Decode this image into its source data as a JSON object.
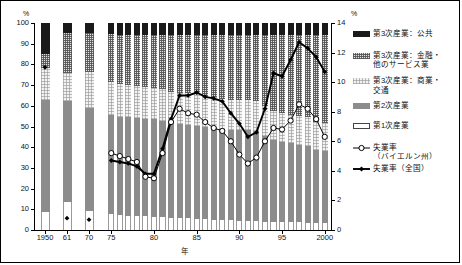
{
  "axes": {
    "left_unit": "%",
    "right_unit": "%",
    "xlabel": "年",
    "left_ticks": [
      "0",
      "10",
      "20",
      "30",
      "40",
      "50",
      "60",
      "70",
      "80",
      "90",
      "100"
    ],
    "right_ticks": [
      "0",
      "2",
      "4",
      "6",
      "8",
      "10",
      "12",
      "14"
    ],
    "x_ticks": [
      "1950",
      "61",
      "70",
      "75",
      "80",
      "85",
      "90",
      "95",
      "2000"
    ]
  },
  "legend": {
    "items": [
      {
        "name": "tertiary-public",
        "label": "第3次産業：公共",
        "label2": "",
        "swatch": "solid-black",
        "color": "#1a1a1a"
      },
      {
        "name": "tertiary-finance",
        "label": "第3次産業：金融・",
        "label2": "他のサービス業",
        "swatch": "hatch-dark",
        "color": "#e2e2e2"
      },
      {
        "name": "tertiary-commerce",
        "label": "第3次産業：商業・",
        "label2": "交通",
        "swatch": "hatch-light",
        "color": "#f2f2f2"
      },
      {
        "name": "secondary",
        "label": "第2次産業",
        "label2": "",
        "swatch": "solid-gray",
        "color": "#8c8c8c"
      },
      {
        "name": "primary",
        "label": "第1次産業",
        "label2": "",
        "swatch": "outline-white",
        "color": "#ffffff"
      },
      {
        "name": "unemp-bavaria",
        "label": "失業率",
        "label2": "（バイエルン州）",
        "swatch": "line-open-circle",
        "color": "#000000"
      },
      {
        "name": "unemp-national",
        "label": "失業率（全国）",
        "label2": "",
        "swatch": "line-filled-diamond",
        "color": "#000000"
      }
    ]
  },
  "chart_data": {
    "type": "bar",
    "title": "",
    "xlabel": "年",
    "ylabel": "%",
    "ylim": [
      0,
      100
    ],
    "y2lim": [
      0,
      14
    ],
    "grid": false,
    "legend_position": "right",
    "categories": [
      "1950",
      "61",
      "70",
      "75",
      "76",
      "77",
      "78",
      "79",
      "80",
      "81",
      "82",
      "83",
      "84",
      "85",
      "86",
      "87",
      "88",
      "89",
      "90",
      "91",
      "92",
      "93",
      "94",
      "95",
      "96",
      "97",
      "98",
      "99",
      "2000"
    ],
    "series": [
      {
        "name": "第1次産業",
        "axis": "left",
        "values": [
          8.5,
          13.5,
          9.0,
          7.5,
          7.2,
          7.0,
          6.8,
          6.6,
          6.4,
          6.2,
          6.0,
          5.8,
          5.6,
          5.4,
          5.2,
          5.0,
          4.8,
          4.6,
          4.4,
          4.3,
          4.2,
          4.1,
          4.0,
          3.9,
          3.8,
          3.7,
          3.6,
          3.5,
          3.4
        ]
      },
      {
        "name": "第2次産業",
        "axis": "left",
        "values": [
          54.5,
          49.0,
          50.0,
          48.0,
          47.5,
          47.5,
          47.2,
          47.0,
          47.0,
          46.6,
          45.4,
          45.3,
          45.2,
          45.0,
          44.6,
          44.2,
          43.8,
          43.5,
          44.0,
          44.0,
          43.6,
          41.5,
          39.4,
          38.6,
          38.0,
          37.5,
          37.0,
          35.3,
          34.9
        ]
      },
      {
        "name": "第3次産業：商業・交通",
        "axis": "left",
        "values": [
          15.5,
          13.5,
          17.5,
          16.0,
          15.8,
          15.7,
          15.6,
          15.5,
          15.4,
          15.4,
          15.3,
          15.2,
          15.2,
          15.1,
          15.0,
          14.9,
          14.8,
          14.7,
          14.6,
          14.5,
          14.4,
          14.3,
          14.2,
          14.1,
          14.0,
          13.9,
          13.8,
          13.6,
          13.5
        ]
      },
      {
        "name": "第3次産業：金融・他のサービス業",
        "axis": "left",
        "values": [
          6.5,
          19.0,
          18.5,
          23.0,
          23.5,
          23.8,
          24.4,
          24.9,
          25.2,
          25.8,
          27.3,
          27.7,
          28.0,
          28.5,
          29.2,
          29.9,
          30.6,
          31.2,
          31.0,
          31.2,
          31.8,
          34.1,
          36.4,
          37.4,
          38.2,
          38.9,
          39.6,
          41.6,
          42.2
        ]
      },
      {
        "name": "第3次産業：公共",
        "axis": "left",
        "values": [
          15.0,
          5.0,
          5.0,
          5.5,
          6.0,
          6.0,
          6.0,
          6.0,
          6.0,
          6.0,
          6.0,
          6.0,
          6.0,
          6.0,
          6.0,
          6.0,
          6.0,
          6.0,
          6.0,
          6.0,
          6.0,
          6.0,
          6.0,
          6.0,
          6.0,
          6.0,
          6.0,
          6.0,
          6.0
        ]
      }
    ],
    "lines": [
      {
        "name": "失業率（全国）",
        "axis": "right",
        "marker": "filled-diamond",
        "x": [
          "1950",
          "61",
          "70",
          "75",
          "76",
          "77",
          "78",
          "79",
          "80",
          "81",
          "82",
          "83",
          "84",
          "85",
          "86",
          "87",
          "88",
          "89",
          "90",
          "91",
          "92",
          "93",
          "94",
          "95",
          "96",
          "97",
          "98",
          "99",
          "2000"
        ],
        "values": [
          11.0,
          0.8,
          0.7,
          4.7,
          4.6,
          4.5,
          4.3,
          3.8,
          3.8,
          5.5,
          7.5,
          9.1,
          9.1,
          9.3,
          9.0,
          8.9,
          8.7,
          7.9,
          7.2,
          6.3,
          6.6,
          8.2,
          10.6,
          10.4,
          11.5,
          12.7,
          12.3,
          11.7,
          10.7
        ]
      },
      {
        "name": "失業率（バイエルン州）",
        "axis": "right",
        "marker": "open-circle",
        "x": [
          "75",
          "76",
          "77",
          "78",
          "79",
          "80",
          "81",
          "82",
          "83",
          "84",
          "85",
          "86",
          "87",
          "88",
          "89",
          "90",
          "91",
          "92",
          "93",
          "94",
          "95",
          "96",
          "97",
          "98",
          "99",
          "2000"
        ],
        "values": [
          5.2,
          5.0,
          4.8,
          4.6,
          3.6,
          3.5,
          5.2,
          7.3,
          8.2,
          7.9,
          7.8,
          7.3,
          6.9,
          6.7,
          6.0,
          5.1,
          4.5,
          4.9,
          6.0,
          6.9,
          6.8,
          7.4,
          8.5,
          8.2,
          7.5,
          6.3
        ]
      }
    ]
  }
}
